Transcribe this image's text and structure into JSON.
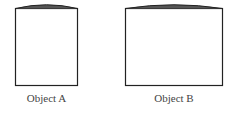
{
  "diagram": {
    "objects": [
      {
        "label": "Object A"
      },
      {
        "label": "Object B"
      }
    ]
  }
}
